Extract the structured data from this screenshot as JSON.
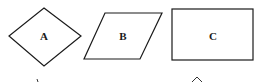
{
  "figure": {
    "shapes": [
      {
        "id": "A",
        "label": "A",
        "kind": "rhombus"
      },
      {
        "id": "B",
        "label": "B",
        "kind": "parallelogram"
      },
      {
        "id": "C",
        "label": "C",
        "kind": "rectangle"
      }
    ],
    "stroke_color": "#1a1a1a",
    "background": "#ffffff"
  }
}
